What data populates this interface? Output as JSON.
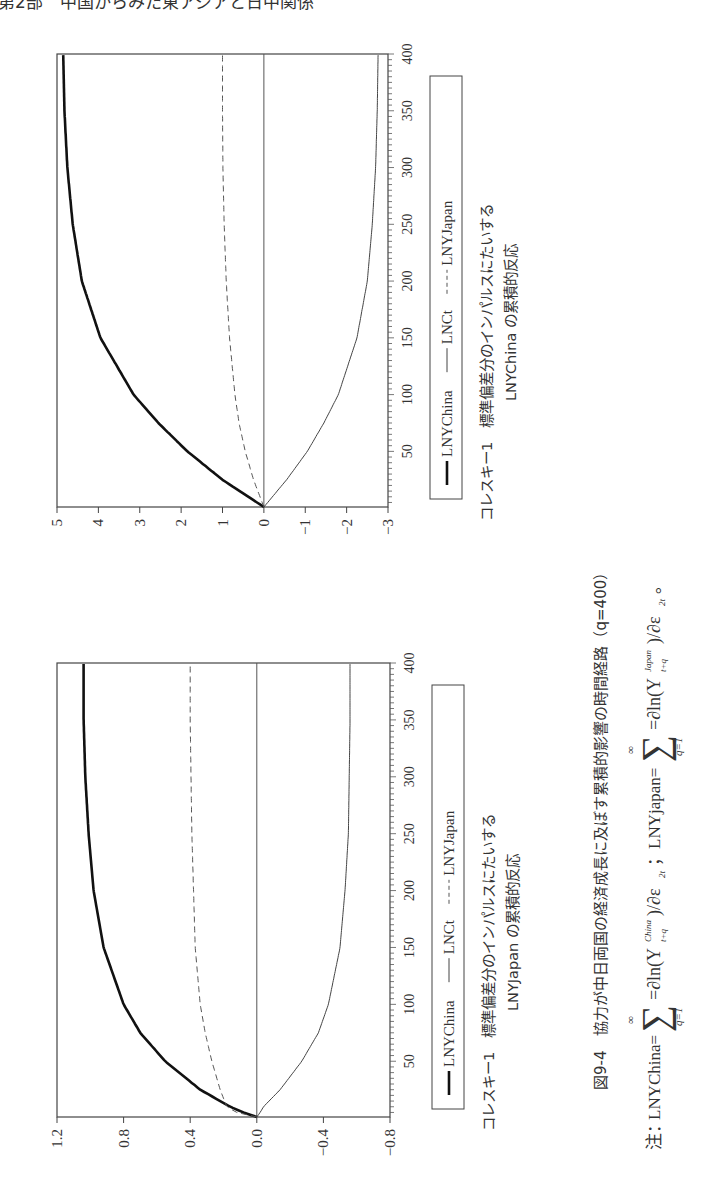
{
  "page_header": "第2部　中国からみた東アジアと日中関係",
  "figure": {
    "title": "図9-4　協力が中日両国の経済成長に及ぼす累積的影響の時間経路（q=400）",
    "note_prefix": "注：",
    "note_china": "LNYChina=",
    "note_japan": "；LNYjapan=",
    "note_end": "。"
  },
  "legend": {
    "items": [
      {
        "label": "LNYChina",
        "style": "thick-solid"
      },
      {
        "label": "LNCt",
        "style": "thin-solid"
      },
      {
        "label": "LNYJapan",
        "style": "dashed"
      }
    ]
  },
  "panels": [
    {
      "caption_line1": "コレスキー1　標準偏差分のインパルスにたいする",
      "caption_line2": "LNYJapan の累積的反応"
    },
    {
      "caption_line1": "コレスキー1　標準偏差分のインパルスにたいする",
      "caption_line2": "LNYChina の累積的反応"
    }
  ],
  "chart_data": [
    {
      "type": "line",
      "title": "コレスキー1 標準偏差分のインパルスにたいする LNYJapan の累積的反応",
      "xlabel": "",
      "ylabel": "",
      "x_ticks": [
        50,
        100,
        150,
        200,
        250,
        300,
        350,
        400
      ],
      "y_ticks": [
        1.2,
        0.8,
        0.4,
        0.0,
        -0.4,
        -0.8
      ],
      "xlim": [
        1,
        400
      ],
      "ylim": [
        -0.8,
        1.2
      ],
      "legend": [
        "LNYChina",
        "LNCt",
        "LNYJapan"
      ],
      "legend_position": "bottom",
      "x": [
        1,
        5,
        10,
        25,
        50,
        75,
        100,
        150,
        200,
        250,
        300,
        350,
        400
      ],
      "series": [
        {
          "name": "LNYChina",
          "values": [
            0.0,
            0.08,
            0.16,
            0.34,
            0.55,
            0.7,
            0.8,
            0.92,
            0.98,
            1.01,
            1.03,
            1.04,
            1.04
          ]
        },
        {
          "name": "LNCt",
          "values": [
            0.0,
            -0.02,
            -0.04,
            -0.14,
            -0.27,
            -0.37,
            -0.43,
            -0.5,
            -0.53,
            -0.55,
            -0.555,
            -0.56,
            -0.56
          ]
        },
        {
          "name": "LNYJapan",
          "values": [
            0.0,
            0.12,
            0.18,
            0.22,
            0.27,
            0.31,
            0.34,
            0.37,
            0.38,
            0.39,
            0.395,
            0.4,
            0.4
          ]
        }
      ]
    },
    {
      "type": "line",
      "title": "コレスキー1 標準偏差分のインパルスにたいする LNYChina の累積的反応",
      "xlabel": "",
      "ylabel": "",
      "x_ticks": [
        50,
        100,
        150,
        200,
        250,
        300,
        350,
        400
      ],
      "y_ticks": [
        5,
        4,
        3,
        2,
        1,
        0,
        -1,
        -2,
        -3
      ],
      "xlim": [
        1,
        400
      ],
      "ylim": [
        -3,
        5
      ],
      "legend": [
        "LNYChina",
        "LNCt",
        "LNYJapan"
      ],
      "legend_position": "bottom",
      "x": [
        1,
        25,
        50,
        75,
        100,
        150,
        200,
        250,
        300,
        350,
        400
      ],
      "series": [
        {
          "name": "LNYChina",
          "values": [
            0.0,
            1.0,
            1.85,
            2.55,
            3.15,
            3.95,
            4.4,
            4.62,
            4.75,
            4.82,
            4.85
          ]
        },
        {
          "name": "LNCt",
          "values": [
            0.0,
            -0.55,
            -1.05,
            -1.45,
            -1.8,
            -2.25,
            -2.5,
            -2.62,
            -2.7,
            -2.74,
            -2.76
          ]
        },
        {
          "name": "LNYJapan",
          "values": [
            0.0,
            0.25,
            0.45,
            0.6,
            0.7,
            0.83,
            0.91,
            0.96,
            0.99,
            1.0,
            1.0
          ]
        }
      ]
    }
  ]
}
